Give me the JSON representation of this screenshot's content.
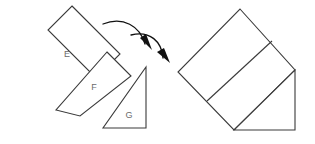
{
  "figure": {
    "stroke_color": "#3a3a3a",
    "fill_color": "#ffffff",
    "label_color": "#6b6b6b",
    "arrow_color": "#111111",
    "background": "#ffffff",
    "left_group": {
      "name": "exploded-pieces",
      "pieces": [
        {
          "id": "E",
          "label": "E",
          "shape": "square",
          "points": "72,6 120,54 96,78 48,30",
          "label_x": 67,
          "label_y": 55
        },
        {
          "id": "F",
          "label": "F",
          "shape": "parallelogram",
          "points": "107,52 131,76 80,116 56,110",
          "label_x": 94,
          "label_y": 88
        },
        {
          "id": "G",
          "label": "G",
          "shape": "right-triangle",
          "points": "146,67 146,128 103,128",
          "label_x": 129,
          "label_y": 116
        }
      ],
      "arrows": [
        {
          "id": "arrow-1",
          "label": "move-piece-f-arrow",
          "path": "M 103,24 C 123,16 140,26 145,44",
          "head": "140,38 152,50 146,34"
        },
        {
          "id": "arrow-2",
          "label": "move-piece-g-arrow",
          "path": "M 131,35 C 150,30 162,42 163,58",
          "head": "157,52 170,63 164,48"
        }
      ]
    },
    "right_group": {
      "name": "assembled-figure",
      "pieces": [
        {
          "id": "assembled-square",
          "label": "",
          "shape": "square",
          "points": "240,9 295,70 234,130 178,72"
        },
        {
          "id": "assembled-triangle",
          "label": "",
          "shape": "right-triangle",
          "points": "295,70 295,130 234,130"
        }
      ],
      "dividers": [
        {
          "id": "square-diagonal",
          "label": "interior-diagonal",
          "path": "M 272,41 L 207,101"
        }
      ]
    }
  }
}
